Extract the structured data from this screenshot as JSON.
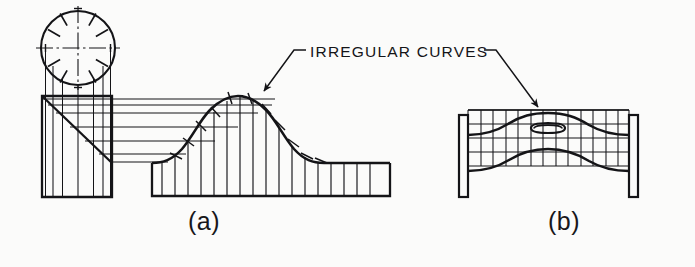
{
  "figure": {
    "title_visible": false,
    "background_color": "#fbfbfa",
    "ink_color": "#141417",
    "callouts": [
      {
        "id": "irregular-curves",
        "text": "IRREGULAR  CURVES",
        "leader_left_target": "peak-of-curve-figure-a",
        "leader_right_target": "upper-curve-figure-b"
      }
    ],
    "subfigures": [
      {
        "id": "a",
        "caption": "(a)",
        "description": "orthographic projection: circle with division tick marks projected down into a block with a diagonal, producing a bell-shaped irregular curve over a base",
        "elements": {
          "circle_divisions": 12,
          "ordinate_count": 13,
          "projector_line_count": 6
        }
      },
      {
        "id": "b",
        "caption": "(b)",
        "description": "gridded development showing irregular curves bounding a shape with a slotted oval opening, supported between two vertical posts",
        "elements": {
          "grid_columns": 13,
          "grid_rows": 5,
          "post_count": 2,
          "slot_count": 1
        }
      }
    ]
  }
}
